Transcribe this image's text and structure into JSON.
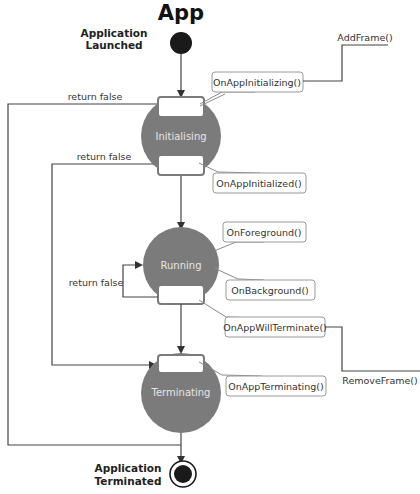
{
  "title": "App",
  "start": {
    "label_line1": "Application",
    "label_line2": "Launched"
  },
  "end": {
    "label_line1": "Application",
    "label_line2": "Terminated"
  },
  "states": [
    {
      "name": "Initialising"
    },
    {
      "name": "Running"
    },
    {
      "name": "Terminating"
    }
  ],
  "transitions": {
    "return_false_1": "return false",
    "return_false_2": "return false",
    "return_false_3": "return false"
  },
  "callouts": {
    "on_app_initializing": "OnAppInitializing()",
    "on_app_initialized": "OnAppInitialized()",
    "on_foreground": "OnForeground()",
    "on_background": "OnBackground()",
    "on_app_will_terminate": "OnAppWillTerminate()",
    "on_app_terminating": "OnAppTerminating()"
  },
  "annotations": {
    "add_frame": "AddFrame()",
    "remove_frame": "RemoveFrame()"
  },
  "colors": {
    "state_fill": "#7b7b7b",
    "state_text": "#e6e6e6",
    "line": "#444444",
    "callout_border": "#8a8a8a",
    "node": "#1a1a1a"
  }
}
